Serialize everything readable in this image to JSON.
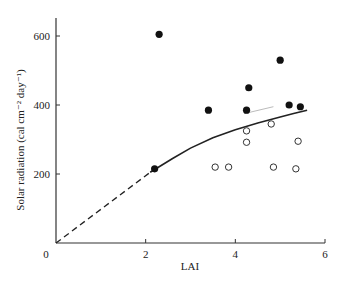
{
  "chart_data": {
    "type": "scatter",
    "title": "",
    "xlabel": "LAI",
    "ylabel": "Solar radiation (cal cm⁻² day⁻¹)",
    "xlim": [
      0,
      6
    ],
    "ylim": [
      0,
      650
    ],
    "xticks": [
      0,
      2,
      4,
      6
    ],
    "yticks": [
      200,
      400,
      600
    ],
    "x_tick_labels": [
      "0",
      "2",
      "4",
      "6"
    ],
    "y_tick_labels": [
      "200",
      "400",
      "600"
    ],
    "origin_label": "0",
    "grid": false,
    "legend": null,
    "series": [
      {
        "name": "filled",
        "marker": "filled-circle",
        "points": [
          [
            2.2,
            215
          ],
          [
            2.3,
            605
          ],
          [
            3.4,
            385
          ],
          [
            4.25,
            385
          ],
          [
            4.3,
            450
          ],
          [
            5.0,
            530
          ],
          [
            5.2,
            400
          ],
          [
            5.45,
            395
          ]
        ]
      },
      {
        "name": "open",
        "marker": "open-circle",
        "points": [
          [
            3.55,
            220
          ],
          [
            3.85,
            220
          ],
          [
            4.25,
            325
          ],
          [
            4.25,
            292
          ],
          [
            4.8,
            345
          ],
          [
            4.85,
            220
          ],
          [
            5.35,
            215
          ],
          [
            5.4,
            295
          ]
        ]
      },
      {
        "name": "fitted-curve",
        "style": "solid",
        "points": [
          [
            2.1,
            205
          ],
          [
            2.6,
            245
          ],
          [
            3.0,
            275
          ],
          [
            3.5,
            305
          ],
          [
            4.0,
            328
          ],
          [
            4.5,
            348
          ],
          [
            5.0,
            365
          ],
          [
            5.3,
            375
          ],
          [
            5.6,
            385
          ]
        ]
      },
      {
        "name": "extrapolation",
        "style": "dashed",
        "points": [
          [
            0,
            0
          ],
          [
            2.1,
            205
          ]
        ]
      },
      {
        "name": "faint-line",
        "style": "light-solid",
        "points": [
          [
            4.2,
            375
          ],
          [
            4.85,
            395
          ]
        ]
      }
    ]
  }
}
